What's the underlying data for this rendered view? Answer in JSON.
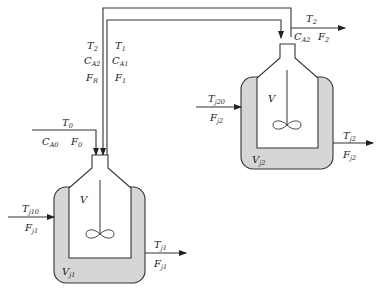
{
  "diagram": {
    "type": "two CSTRs in series with recycle and cooling jackets",
    "colors": {
      "line": "#333333",
      "jacket_fill": "#d6d6d6",
      "background": "#ffffff"
    },
    "recycle_stream": {
      "left_labels": [
        {
          "base": "T",
          "sub": "2"
        },
        {
          "base": "C",
          "sub": "A2"
        },
        {
          "base": "F",
          "sub": "R"
        }
      ],
      "right_labels": [
        {
          "base": "T",
          "sub": "1"
        },
        {
          "base": "C",
          "sub": "A1"
        },
        {
          "base": "F",
          "sub": "1"
        }
      ]
    },
    "feed_stream": {
      "top_label": {
        "base": "T",
        "sub": "0"
      },
      "bottom_labels": [
        {
          "base": "C",
          "sub": "A0"
        },
        {
          "base": "F",
          "sub": "0"
        }
      ]
    },
    "product_stream": {
      "top_label": {
        "base": "T",
        "sub": "2"
      },
      "bottom_labels": [
        {
          "base": "C",
          "sub": "A2"
        },
        {
          "base": "F",
          "sub": "2"
        }
      ]
    },
    "reactor1": {
      "volume_label": "V",
      "jacket_volume": {
        "base": "V",
        "sub": "j1"
      },
      "jacket_inlet": [
        {
          "base": "T",
          "sub": "j10"
        },
        {
          "base": "F",
          "sub": "j1"
        }
      ],
      "jacket_outlet": [
        {
          "base": "T",
          "sub": "j1"
        },
        {
          "base": "F",
          "sub": "j1"
        }
      ]
    },
    "reactor2": {
      "volume_label": "V",
      "jacket_volume": {
        "base": "V",
        "sub": "j2"
      },
      "jacket_inlet": [
        {
          "base": "T",
          "sub": "j20"
        },
        {
          "base": "F",
          "sub": "j2"
        }
      ],
      "jacket_outlet": [
        {
          "base": "T",
          "sub": "j2"
        },
        {
          "base": "F",
          "sub": "j2"
        }
      ]
    }
  }
}
